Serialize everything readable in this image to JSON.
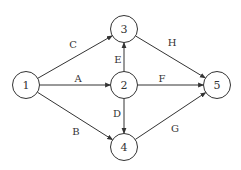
{
  "diagram": {
    "type": "network",
    "nodes": [
      {
        "id": "1",
        "label": "1",
        "x": 26,
        "y": 85
      },
      {
        "id": "2",
        "label": "2",
        "x": 124,
        "y": 85
      },
      {
        "id": "3",
        "label": "3",
        "x": 124,
        "y": 29
      },
      {
        "id": "4",
        "label": "4",
        "x": 124,
        "y": 147
      },
      {
        "id": "5",
        "label": "5",
        "x": 217,
        "y": 85
      }
    ],
    "edges": [
      {
        "id": "A",
        "label": "A",
        "from": "1",
        "to": "2",
        "lx": 78,
        "ly": 78
      },
      {
        "id": "B",
        "label": "B",
        "from": "1",
        "to": "4",
        "lx": 76,
        "ly": 131
      },
      {
        "id": "C",
        "label": "C",
        "from": "1",
        "to": "3",
        "lx": 73,
        "ly": 44
      },
      {
        "id": "D",
        "label": "D",
        "from": "2",
        "to": "4",
        "lx": 117,
        "ly": 113
      },
      {
        "id": "E",
        "label": "E",
        "from": "2",
        "to": "3",
        "lx": 118,
        "ly": 59
      },
      {
        "id": "F",
        "label": "F",
        "from": "2",
        "to": "5",
        "lx": 162,
        "ly": 78
      },
      {
        "id": "G",
        "label": "G",
        "from": "4",
        "to": "5",
        "lx": 175,
        "ly": 128
      },
      {
        "id": "H",
        "label": "H",
        "from": "3",
        "to": "5",
        "lx": 172,
        "ly": 42
      }
    ]
  }
}
